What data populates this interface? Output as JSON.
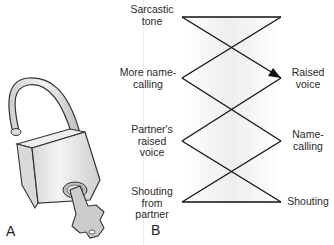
{
  "panels": {
    "a_label": "A",
    "b_label": "B"
  },
  "lock": {
    "icon": "padlock-with-key",
    "colors": {
      "body": "#e6e6e6",
      "outline": "#333333",
      "key": "#cfcfcf"
    }
  },
  "diagram": {
    "left_labels": [
      "Sarcastic\ntone",
      "More name-\ncalling",
      "Partner's\nraised\nvoice",
      "Shouting\nfrom\npartner"
    ],
    "right_labels": [
      "Raised\nvoice",
      "Name-\ncalling",
      "Shouting"
    ],
    "line_color": "#111111",
    "arrow_target": "Raised voice"
  }
}
